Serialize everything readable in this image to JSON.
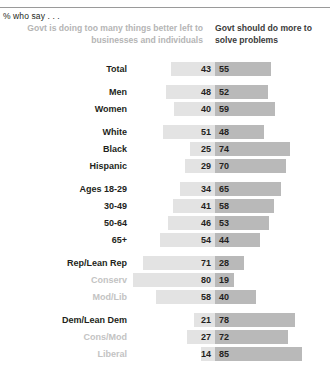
{
  "kicker": "% who say . . .",
  "headers": {
    "left": "Govt is doing too many things better left to businesses and individuals",
    "right": "Govt should do more to solve problems"
  },
  "colors": {
    "left_bar": "#e3e3e3",
    "right_bar": "#b9b9b9",
    "label": "#231f20",
    "muted_label": "#c3c3c3",
    "header_left": "#b5b5b5",
    "header_right": "#3b3b3b"
  },
  "chart_data": {
    "type": "bar",
    "title": "",
    "subtitle": "% who say . . .",
    "orientation": "horizontal-diverging",
    "xlabel": "",
    "ylabel": "",
    "xlim": [
      0,
      100
    ],
    "grid": false,
    "legend_position": "top",
    "series": [
      {
        "name": "Govt is doing too many things better left to businesses and individuals",
        "side": "left",
        "color": "#e3e3e3"
      },
      {
        "name": "Govt should do more to solve problems",
        "side": "right",
        "color": "#b9b9b9"
      }
    ],
    "categories": [
      "Total",
      "Men",
      "Women",
      "White",
      "Black",
      "Hispanic",
      "Ages 18-29",
      "30-49",
      "50-64",
      "65+",
      "Rep/Lean Rep",
      "Conserv",
      "Mod/Lib",
      "Dem/Lean Dem",
      "Cons/Mod",
      "Liberal"
    ],
    "left_values": [
      43,
      48,
      40,
      51,
      25,
      29,
      34,
      41,
      46,
      54,
      71,
      80,
      58,
      21,
      27,
      14
    ],
    "right_values": [
      55,
      52,
      59,
      48,
      74,
      70,
      65,
      58,
      53,
      44,
      28,
      19,
      40,
      78,
      72,
      85
    ]
  },
  "groups": [
    {
      "rows": [
        {
          "label": "Total",
          "left": 43,
          "right": 55,
          "muted": false
        }
      ]
    },
    {
      "rows": [
        {
          "label": "Men",
          "left": 48,
          "right": 52,
          "muted": false
        },
        {
          "label": "Women",
          "left": 40,
          "right": 59,
          "muted": false
        }
      ]
    },
    {
      "rows": [
        {
          "label": "White",
          "left": 51,
          "right": 48,
          "muted": false
        },
        {
          "label": "Black",
          "left": 25,
          "right": 74,
          "muted": false
        },
        {
          "label": "Hispanic",
          "left": 29,
          "right": 70,
          "muted": false
        }
      ]
    },
    {
      "rows": [
        {
          "label": "Ages 18-29",
          "left": 34,
          "right": 65,
          "muted": false
        },
        {
          "label": "30-49",
          "left": 41,
          "right": 58,
          "muted": false
        },
        {
          "label": "50-64",
          "left": 46,
          "right": 53,
          "muted": false
        },
        {
          "label": "65+",
          "left": 54,
          "right": 44,
          "muted": false
        }
      ]
    },
    {
      "rows": [
        {
          "label": "Rep/Lean Rep",
          "left": 71,
          "right": 28,
          "muted": false
        },
        {
          "label": "Conserv",
          "left": 80,
          "right": 19,
          "muted": true
        },
        {
          "label": "Mod/Lib",
          "left": 58,
          "right": 40,
          "muted": true
        }
      ]
    },
    {
      "rows": [
        {
          "label": "Dem/Lean Dem",
          "left": 21,
          "right": 78,
          "muted": false
        },
        {
          "label": "Cons/Mod",
          "left": 27,
          "right": 72,
          "muted": true
        },
        {
          "label": "Liberal",
          "left": 14,
          "right": 85,
          "muted": true
        }
      ]
    }
  ]
}
